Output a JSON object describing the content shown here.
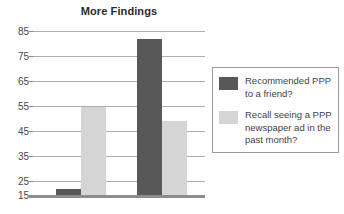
{
  "chart_data": {
    "type": "bar",
    "title": "More Findings",
    "xlabel": "",
    "ylabel": "",
    "ylim": [
      15,
      85
    ],
    "yticks": [
      15,
      25,
      35,
      45,
      55,
      65,
      75,
      85
    ],
    "grid": true,
    "legend_position": "right",
    "categories": [
      "Group 1",
      "Group 2"
    ],
    "series": [
      {
        "name": "Recommended PPP to a friend?",
        "color": "#585858",
        "values": [
          17.5,
          81.5
        ]
      },
      {
        "name": "Recall seeing a PPP newspaper ad in the past month?",
        "color": "#d5d5d5",
        "values": [
          52.5,
          46.5
        ]
      }
    ]
  },
  "chart": {
    "title": "More Findings",
    "axis": {
      "y_tick_labels": [
        "85",
        "75",
        "65",
        "55",
        "45",
        "35",
        "25",
        "15"
      ],
      "y_min": 15,
      "y_max": 85
    },
    "bars": [
      {
        "name": "bar-dark-1",
        "series": "Recommended PPP to a friend?",
        "value": 17.5,
        "color": "#585858"
      },
      {
        "name": "bar-light-1",
        "series": "Recall seeing a PPP newspaper ad in the past month?",
        "value": 52.5,
        "color": "#d5d5d5"
      },
      {
        "name": "bar-dark-2",
        "series": "Recommended PPP to a friend?",
        "value": 81.5,
        "color": "#585858"
      },
      {
        "name": "bar-light-2",
        "series": "Recall seeing a PPP newspaper ad in the past month?",
        "value": 46.5,
        "color": "#d5d5d5"
      }
    ]
  },
  "legend": {
    "entries": [
      {
        "swatch": "#585858",
        "label": "Recommended PPP to a friend?"
      },
      {
        "swatch": "#d5d5d5",
        "label": "Recall seeing a PPP newspaper ad in the past month?"
      }
    ]
  },
  "colors": {
    "series_dark": "#585858",
    "series_light": "#d5d5d5",
    "gridline": "#aeaeae",
    "axis": "#8d8d8d",
    "text": "#3f3f3f"
  }
}
